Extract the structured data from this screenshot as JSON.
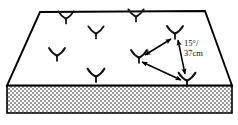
{
  "figure": {
    "type": "technical-illustration",
    "colors": {
      "outline": "#000000",
      "top_surface": "#ffffff",
      "side_face_fill": "#b9b9b9",
      "side_face_pattern": "checkerboard-stipple",
      "plant": "#111111",
      "arrow": "#000000",
      "text": "#111111"
    },
    "slab": {
      "top_face_points": "40,12 205,11 232,85 7,85",
      "front_face_points": "7,85 232,85 232,113 7,113",
      "top_face_label": "planting-bed-top-surface",
      "front_face_label": "planting-bed-front-edge"
    },
    "plants": [
      {
        "id": "plant-1",
        "x": 66,
        "y": 18,
        "scale": 1.0
      },
      {
        "id": "plant-2",
        "x": 136,
        "y": 16,
        "scale": 1.0
      },
      {
        "id": "plant-3",
        "x": 96,
        "y": 33,
        "scale": 1.0
      },
      {
        "id": "plant-4",
        "x": 175,
        "y": 33,
        "scale": 1.05
      },
      {
        "id": "plant-5",
        "x": 57,
        "y": 55,
        "scale": 1.05
      },
      {
        "id": "plant-6",
        "x": 139,
        "y": 57,
        "scale": 1.05
      },
      {
        "id": "plant-7",
        "x": 96,
        "y": 76,
        "scale": 1.1
      },
      {
        "id": "plant-8",
        "x": 187,
        "y": 80,
        "scale": 1.1
      }
    ],
    "arrows": [
      {
        "id": "arrow-upper-left",
        "from": {
          "x": 171,
          "y": 39
        },
        "to": {
          "x": 145,
          "y": 55
        },
        "double_headed": true
      },
      {
        "id": "arrow-vertical-right",
        "from": {
          "x": 178,
          "y": 40
        },
        "to": {
          "x": 185,
          "y": 74
        },
        "double_headed": true
      },
      {
        "id": "arrow-lower-diagonal",
        "from": {
          "x": 181,
          "y": 80
        },
        "to": {
          "x": 142,
          "y": 62
        },
        "double_headed": true
      }
    ],
    "annotations": [
      {
        "id": "angle-label",
        "text": "15°/",
        "x": 184,
        "y": 46
      },
      {
        "id": "distance-label",
        "text": "37cm",
        "x": 184,
        "y": 56
      }
    ]
  }
}
